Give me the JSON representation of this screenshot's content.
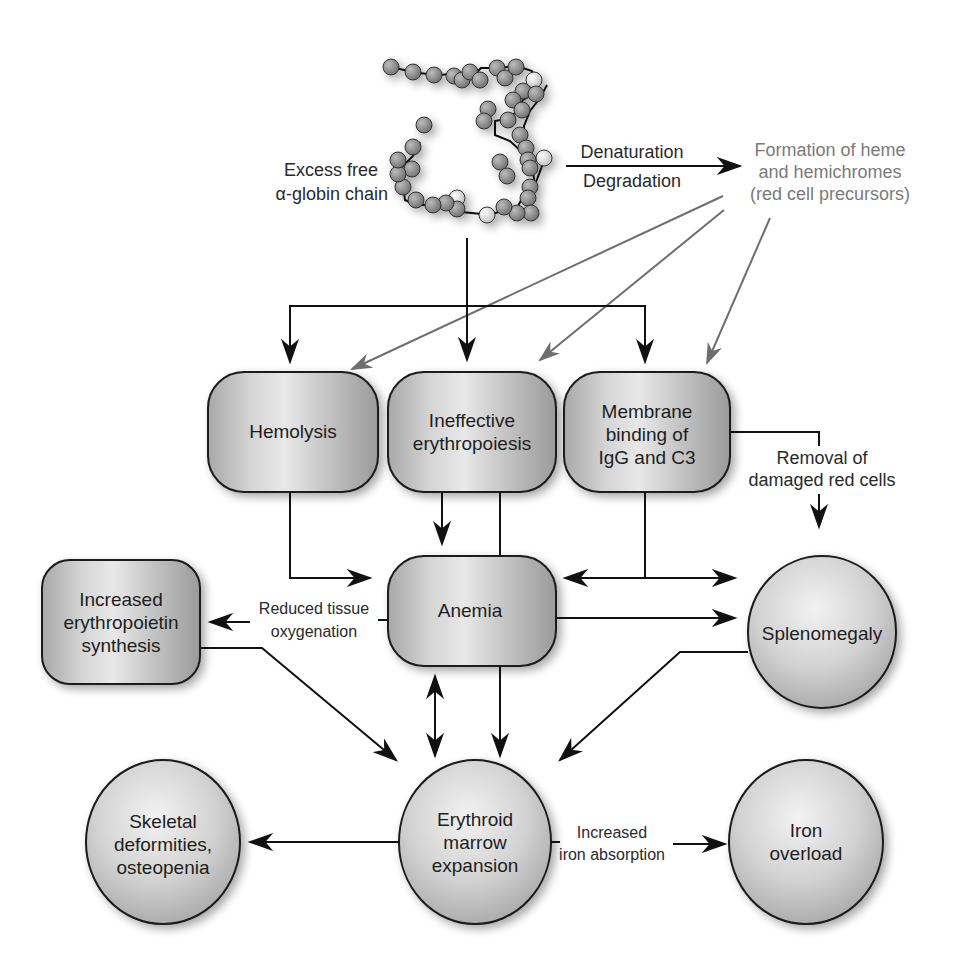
{
  "source": {
    "label_line1": "Excess free",
    "label_line2": "α-globin chain",
    "icon": "protein-chain-icon"
  },
  "process": {
    "above_arrow": "Denaturation",
    "below_arrow": "Degradation"
  },
  "product": {
    "line1": "Formation of heme",
    "line2": "and hemichromes",
    "line3": "(red cell precursors)",
    "color": "#7a7a7a"
  },
  "nodes": {
    "hemolysis": {
      "lines": [
        "Hemolysis"
      ]
    },
    "ineffective": {
      "lines": [
        "Ineffective",
        "erythropoiesis"
      ]
    },
    "membrane": {
      "lines": [
        "Membrane",
        "binding of",
        "IgG and C3"
      ]
    },
    "anemia": {
      "lines": [
        "Anemia"
      ]
    },
    "epo": {
      "lines": [
        "Increased",
        "erythropoietin",
        "synthesis"
      ]
    },
    "splenomegaly": {
      "lines": [
        "Splenomegaly"
      ]
    },
    "skeletal": {
      "lines": [
        "Skeletal",
        "deformities,",
        "osteopenia"
      ]
    },
    "erythroid": {
      "lines": [
        "Erythroid",
        "marrow",
        "expansion"
      ]
    },
    "iron": {
      "lines": [
        "Iron",
        "overload"
      ]
    }
  },
  "edge_labels": {
    "removal": [
      "Removal of",
      "damaged red cells"
    ],
    "oxygenation": [
      "Reduced tissue",
      "oxygenation"
    ],
    "iron_absorption": [
      "Increased",
      "iron absorption"
    ]
  },
  "colors": {
    "node_fill_light": "#e6e6e6",
    "node_fill_dark": "#a9a9a9",
    "line": "#111111",
    "gray_arrow": "#6e6e6e"
  }
}
